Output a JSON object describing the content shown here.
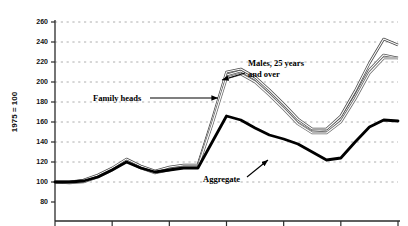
{
  "chart_data": {
    "type": "line",
    "title": "",
    "xlabel": "",
    "ylabel": "1975 = 100",
    "ylim": [
      80,
      260
    ],
    "ytick_values": [
      80,
      100,
      120,
      140,
      160,
      180,
      200,
      220,
      240,
      260
    ],
    "ytick_labels": [
      "80",
      "100",
      "120",
      "140",
      "160",
      "180",
      "200",
      "220",
      "240",
      "260"
    ],
    "xlim": [
      0,
      24
    ],
    "xtick_values": [
      0,
      4,
      8,
      12,
      16,
      20,
      24
    ],
    "xtick_labels": [
      "",
      "",
      "",
      "",
      "",
      "",
      ""
    ],
    "grid": true,
    "grid_style": "dashed",
    "grid_color": "#9a9a9a",
    "legend": "none",
    "series": [
      {
        "name": "Family heads",
        "color": "#555555",
        "style": "double-outline",
        "x": [
          0,
          1,
          2,
          3,
          4,
          5,
          6,
          7,
          8,
          9,
          10,
          11,
          12,
          13,
          14,
          15,
          16,
          17,
          18,
          19,
          20,
          21,
          22,
          23,
          24
        ],
        "values": [
          100,
          100,
          101,
          106,
          113,
          122,
          115,
          110,
          113,
          116,
          116,
          160,
          207,
          211,
          203,
          190,
          176,
          161,
          152,
          151,
          163,
          186,
          212,
          227,
          224
        ]
      },
      {
        "name": "Males, 25 years and over",
        "color": "#4a4a4a",
        "style": "double-outline",
        "x": [
          0,
          1,
          2,
          3,
          4,
          5,
          6,
          7,
          8,
          9,
          10,
          11,
          12,
          13,
          14,
          15,
          16,
          17,
          18,
          19,
          20,
          21,
          22,
          23,
          24
        ],
        "values": [
          100,
          100,
          102,
          107,
          114,
          123,
          116,
          111,
          115,
          117,
          117,
          162,
          210,
          213,
          205,
          192,
          178,
          163,
          153,
          153,
          166,
          191,
          219,
          243,
          237
        ]
      },
      {
        "name": "Third index line",
        "color": "#6a6a6a",
        "style": "double-outline",
        "x": [
          0,
          1,
          2,
          3,
          4,
          5,
          6,
          7,
          8,
          9,
          10,
          11,
          12,
          13,
          14,
          15,
          16,
          17,
          18,
          19,
          20,
          21,
          22,
          23,
          24
        ],
        "values": [
          100,
          99,
          100,
          105,
          112,
          121,
          114,
          109,
          112,
          115,
          115,
          158,
          204,
          208,
          200,
          187,
          173,
          158,
          149,
          149,
          160,
          183,
          209,
          224,
          224
        ]
      },
      {
        "name": "Aggregate",
        "color": "#000000",
        "style": "thick",
        "x": [
          0,
          1,
          2,
          3,
          4,
          5,
          6,
          7,
          8,
          9,
          10,
          11,
          12,
          13,
          14,
          15,
          16,
          17,
          18,
          19,
          20,
          21,
          22,
          23,
          24
        ],
        "values": [
          100,
          100,
          101,
          105,
          112,
          120,
          114,
          110,
          112,
          114,
          114,
          140,
          166,
          162,
          154,
          147,
          143,
          138,
          130,
          122,
          124,
          140,
          155,
          162,
          161
        ]
      }
    ],
    "annotations": [
      {
        "id": "family-heads",
        "text": "Family heads",
        "text_x": 93,
        "text_y": 101,
        "arrow": {
          "x1": 150,
          "y1": 98,
          "x2": 218,
          "y2": 98
        }
      },
      {
        "id": "males-25-and-over",
        "text_line1": "Males, 25 years",
        "text_line2": "and over",
        "text_x": 248,
        "text_y": 66,
        "arrow": {
          "x1": 245,
          "y1": 73,
          "x2": 222,
          "y2": 80
        }
      },
      {
        "id": "aggregate",
        "text": "Aggregate",
        "text_x": 203,
        "text_y": 182,
        "arrow": {
          "x1": 247,
          "y1": 177,
          "x2": 268,
          "y2": 160
        }
      }
    ]
  },
  "axes": {
    "y_axis_title": "1975 = 100"
  }
}
